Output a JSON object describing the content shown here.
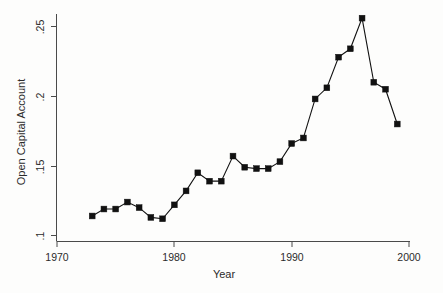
{
  "chart_data": {
    "type": "line",
    "title": "",
    "xlabel": "Year",
    "ylabel": "Open Capital Account",
    "xlim": [
      1970,
      2000
    ],
    "ylim": [
      0.1,
      0.26
    ],
    "grid": false,
    "legend": "none",
    "marker": "filled-square",
    "xticks": [
      1970,
      1980,
      1990,
      2000
    ],
    "xtick_labels": [
      "1970",
      "1980",
      "1990",
      "2000"
    ],
    "yticks": [
      0.1,
      0.15,
      0.2,
      0.25
    ],
    "ytick_labels": [
      ".1",
      ".15",
      ".2",
      ".25"
    ],
    "x": [
      1973,
      1974,
      1975,
      1976,
      1977,
      1978,
      1979,
      1980,
      1981,
      1982,
      1983,
      1984,
      1985,
      1986,
      1987,
      1988,
      1989,
      1990,
      1991,
      1992,
      1993,
      1994,
      1995,
      1996,
      1997,
      1998,
      1999
    ],
    "values": [
      0.114,
      0.119,
      0.119,
      0.124,
      0.12,
      0.113,
      0.112,
      0.122,
      0.132,
      0.145,
      0.139,
      0.139,
      0.157,
      0.149,
      0.148,
      0.148,
      0.153,
      0.166,
      0.17,
      0.198,
      0.206,
      0.228,
      0.234,
      0.256,
      0.21,
      0.205,
      0.18
    ],
    "series": [
      {
        "name": "Open Capital Account",
        "values": [
          0.114,
          0.119,
          0.119,
          0.124,
          0.12,
          0.113,
          0.112,
          0.122,
          0.132,
          0.145,
          0.139,
          0.139,
          0.157,
          0.149,
          0.148,
          0.148,
          0.153,
          0.166,
          0.17,
          0.198,
          0.206,
          0.228,
          0.234,
          0.256,
          0.21,
          0.205,
          0.18
        ]
      }
    ],
    "colors": {
      "line": "#111111",
      "marker": "#111111",
      "axis": "#4a4a4a",
      "background": "#fdfdfc",
      "text": "#2b2b2b"
    }
  },
  "axes": {
    "x_title": "Year",
    "y_title": "Open Capital Account",
    "x_tick_labels": [
      "1970",
      "1980",
      "1990",
      "2000"
    ],
    "y_tick_labels": [
      ".25",
      ".2",
      ".15",
      ".1"
    ]
  }
}
